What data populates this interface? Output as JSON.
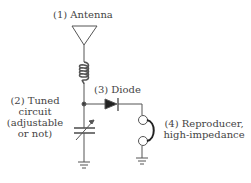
{
  "diagram": {
    "labels": {
      "antenna": "(1) Antenna",
      "tuned_line1": "(2) Tuned",
      "tuned_line2": "circuit",
      "tuned_line3": "(adjustable",
      "tuned_line4": "or not)",
      "diode": "(3) Diode",
      "reproducer_line1": "(4) Reproducer,",
      "reproducer_line2": "high-impedance"
    },
    "components": [
      "antenna",
      "inductor-coil",
      "variable-capacitor",
      "diode",
      "earphone-reproducer",
      "ground",
      "ground"
    ],
    "colors": {
      "line": "#555555",
      "text": "#444444",
      "background": "#ffffff"
    }
  }
}
